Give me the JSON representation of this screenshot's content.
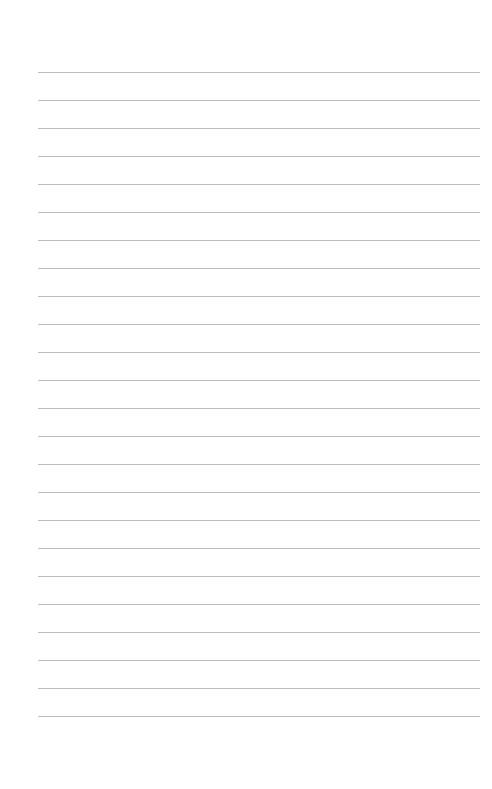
{
  "page": {
    "type": "lined-paper",
    "background_color": "#ffffff",
    "line_color": "#bdbdbd",
    "line_count": 24,
    "first_line_y": 72,
    "line_spacing": 28,
    "line_left": 38,
    "line_right": 480
  }
}
